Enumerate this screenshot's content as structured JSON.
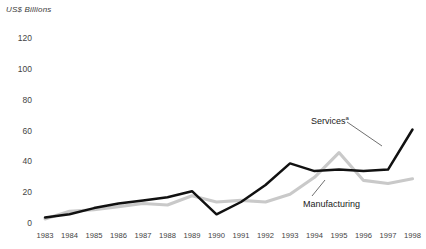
{
  "chart_data": {
    "type": "line",
    "title": "",
    "ylabel": "US$ Billions",
    "xlabel": "",
    "ylim": [
      0,
      120
    ],
    "yticks": [
      0,
      20,
      40,
      60,
      80,
      100,
      120
    ],
    "grid": false,
    "legend_position": "inline-annotations",
    "categories": [
      "1983",
      "1984",
      "1985",
      "1986",
      "1987",
      "1988",
      "1989",
      "1990",
      "1991",
      "1992",
      "1993",
      "1994",
      "1995",
      "1996",
      "1997",
      "1998"
    ],
    "series": [
      {
        "name": "Services",
        "name_superscript": "a",
        "color": "#111111",
        "values": [
          3,
          5,
          9,
          12,
          14,
          16,
          20,
          5,
          13,
          24,
          38,
          33,
          34,
          33,
          34,
          60
        ]
      },
      {
        "name": "Manufacturing",
        "color": "#c9c9c9",
        "values": [
          2,
          7,
          8,
          10,
          12,
          11,
          17,
          13,
          14,
          13,
          18,
          29,
          45,
          27,
          25,
          28
        ]
      }
    ],
    "annotations": [
      {
        "text": "Services",
        "superscript": "a",
        "target_series": "Services"
      },
      {
        "text": "Manufacturing",
        "superscript": "",
        "target_series": "Manufacturing"
      }
    ]
  },
  "axis": {
    "title": "US$ Billions",
    "y_labels": [
      "120",
      "100",
      "80",
      "60",
      "40",
      "20",
      "0"
    ],
    "x_labels": [
      "1983",
      "1984",
      "1985",
      "1986",
      "1987",
      "1988",
      "1989",
      "1990",
      "1991",
      "1992",
      "1993",
      "1994",
      "1995",
      "1996",
      "1997",
      "1998"
    ]
  },
  "labels": {
    "services": "Services",
    "services_superscript": "a",
    "manufacturing": "Manufacturing"
  },
  "colors": {
    "services_line": "#111111",
    "manufacturing_line": "#c9c9c9",
    "text": "#444444",
    "background": "#ffffff"
  }
}
